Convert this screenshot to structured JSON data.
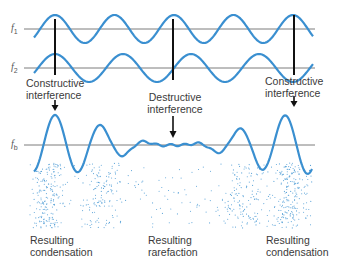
{
  "diagram": {
    "colors": {
      "wave": "#3a8fd0",
      "baseline": "#555555",
      "marker": "#111111",
      "particle": "#5aa3d8",
      "text": "#3a3a3a"
    },
    "waves": [
      {
        "id": "f1",
        "symbol": "f",
        "subscript": "1",
        "baseline_y": 29,
        "period": 59.5,
        "amplitude": 14,
        "phase_peak_x": 55
      },
      {
        "id": "f2",
        "symbol": "f",
        "subscript": "2",
        "baseline_y": 68,
        "period": 68,
        "amplitude": 14,
        "phase_peak_x": 55
      },
      {
        "id": "fb",
        "symbol": "f",
        "subscript": "b",
        "baseline_y": 145
      }
    ],
    "markers": [
      {
        "x": 55,
        "type": "constructive"
      },
      {
        "x": 173,
        "type": "destructive"
      },
      {
        "x": 294,
        "type": "constructive"
      }
    ],
    "annotations": {
      "constructive_left": {
        "line1": "Constructive",
        "line2": "interference"
      },
      "destructive_center": {
        "line1": "Destructive",
        "line2": "interference"
      },
      "constructive_right": {
        "line1": "Constructive",
        "line2": "interference"
      }
    },
    "bottom_labels": {
      "left": {
        "line1": "Resulting",
        "line2": "condensation"
      },
      "center": {
        "line1": "Resulting",
        "line2": "rarefaction"
      },
      "right": {
        "line1": "Resulting",
        "line2": "condensation"
      }
    },
    "particle_band": {
      "x_start": 30,
      "x_end": 312,
      "y_start": 163,
      "y_end": 228,
      "dense_centers": [
        47,
        290
      ],
      "medium_centers": [
        100,
        245
      ]
    }
  }
}
